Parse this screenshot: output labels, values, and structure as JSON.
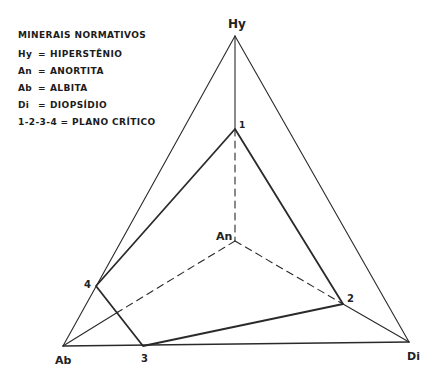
{
  "legend": {
    "title": "MINERAIS NORMATIVOS",
    "items": [
      {
        "symbol": "Hy",
        "eq": "=",
        "name": "HIPERSTÊNIO"
      },
      {
        "symbol": "An",
        "eq": "=",
        "name": "ANORTITA"
      },
      {
        "symbol": "Ab",
        "eq": "=",
        "name": "ALBITA"
      },
      {
        "symbol": "Di",
        "eq": "=",
        "name": "DIOPSÍDIO"
      }
    ],
    "plane_note": "1-2-3-4 = PLANO CRÍTICO"
  },
  "vertices": {
    "Hy": {
      "label": "Hy",
      "x": 235,
      "y": 36
    },
    "An": {
      "label": "An",
      "x": 235,
      "y": 241
    },
    "Ab": {
      "label": "Ab",
      "x": 63,
      "y": 346
    },
    "Di": {
      "label": "Di",
      "x": 409,
      "y": 342
    }
  },
  "plane_points": [
    {
      "label": "1",
      "x": 235,
      "y": 129
    },
    {
      "label": "2",
      "x": 343,
      "y": 304
    },
    {
      "label": "3",
      "x": 143,
      "y": 346
    },
    {
      "label": "4",
      "x": 96,
      "y": 286
    }
  ],
  "colors": {
    "line": "#2a2a2a",
    "background": "#ffffff"
  }
}
